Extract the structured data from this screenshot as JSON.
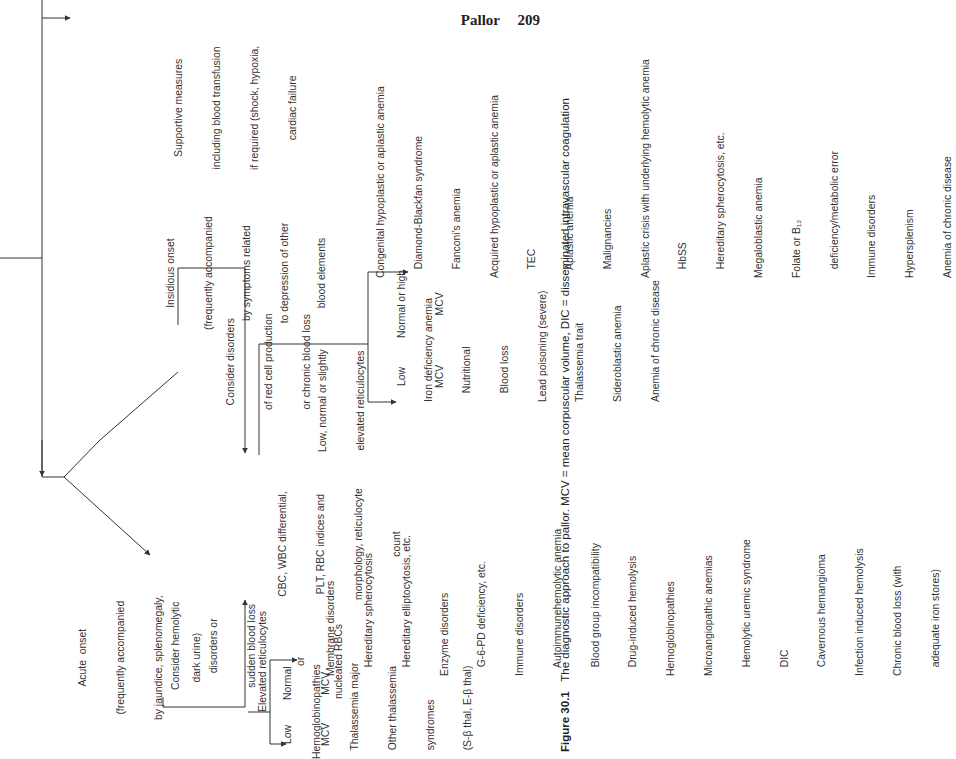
{
  "header": {
    "section": "Pallor",
    "page_number": "209"
  },
  "flow": {
    "pallor_top": "Pallor",
    "supportive": [
      "Supportive measures",
      "including blood transfusion",
      "if required (shock, hypoxia,",
      "cardiac failure"
    ],
    "insidious": [
      "Insidious onset",
      "(frequently accompanied",
      "by symptoms related",
      "to depression of other",
      "blood elements"
    ],
    "acute": [
      "Acute  onset",
      "(frequently accompanied",
      "by jaundice, splenomegaly,",
      "dark urine)"
    ],
    "consider_production": [
      "Consider disorders",
      "of red cell production",
      "or chronic blood loss"
    ],
    "consider_hemolytic": [
      "Consider hemolytic",
      "disorders or",
      "sudden blood loss"
    ],
    "cbc": [
      "CBC, WBC differential,",
      "PLT, RBC indices and",
      "morphology, reticulocyte",
      "count"
    ],
    "low_normal_retic": [
      "Low, normal or slightly",
      "elevated reticulocytes"
    ],
    "elevated_retic": [
      "Elevated reticulocytes",
      "or",
      "nucleated RBCs"
    ],
    "low_mcv_a": [
      "Low",
      "MCV"
    ],
    "normal_mcv": [
      "Normal",
      "MCV"
    ],
    "low_mcv_b": [
      "Low",
      "MCV"
    ],
    "normal_high_mcv": [
      "Normal or high",
      "MCV"
    ],
    "list_hemoglobinopathies": [
      "Hemoglobinopathies",
      "   Thalassemia major",
      "   Other thalassemia",
      "   syndromes",
      "   (S-β thal, E-β thal)"
    ],
    "list_hemolytic": [
      "Membrane disorders",
      "   Hereditary spherocytosis",
      "   Hereditary elliptocytosis, etc.",
      "Enzyme disorders",
      "   G-6-PD deficiency, etc.",
      "Immune disorders",
      "   Autoimmunehemolytic anemia",
      "   Blood group incompatibility",
      "   Drug-induced hemolysis",
      "Hemoglobinopathies",
      "Microangiopathic anemias",
      "   Hemolytic uremic syndrome",
      "   DIC",
      "   Cavernous hemangioma",
      "Infection induced hemolysis",
      "Chronic blood loss (with",
      "   adequate iron stores)"
    ],
    "list_microcytic": [
      "Iron deficiency anemia",
      "   Nutritional",
      "   Blood loss",
      "Lead poisoning (severe)",
      "Thalassemia trait",
      "Sideroblastic anemia",
      "Anemia of chronic disease"
    ],
    "list_normo_macro": [
      "Congenital hypoplastic or aplastic anemia",
      "   Diamond-Blackfan syndrome",
      "   Fanconi's anemia",
      "Acquired hypoplastic or aplastic anemia",
      "   TEC",
      "   Aplastic anemia",
      "   Malignancies",
      "Aplastic crisis with underlying hemolytic anemia",
      "   HbSS",
      "   Hereditary spherocytosis, etc.",
      "Megaloblastic anemia",
      "Folate or B₁₂",
      "   deficiency/metabolic error",
      "Immune disorders",
      "Hypersplenism",
      "Anemia of chronic disease"
    ]
  },
  "caption": {
    "label": "Figure 30.1",
    "text": "The diagnostic approach to pallor. MCV = mean corpuscular volume, DIC = disseminated intravascular coagulation"
  }
}
